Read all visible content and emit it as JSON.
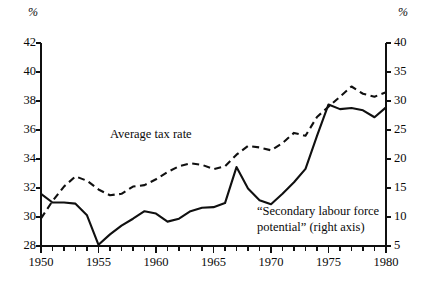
{
  "figure": {
    "left_axis_unit": "%",
    "right_axis_unit": "%",
    "background": "#ffffff",
    "ink": "#101010"
  },
  "labels": {
    "average_tax_rate": "Average tax rate",
    "secondary_line1": "“Secondary labour force",
    "secondary_line2": "potential” (right axis)"
  },
  "axes": {
    "x_tick_labels": [
      "1950",
      "1955",
      "1960",
      "1965",
      "1970",
      "1975",
      "1980"
    ],
    "left_tick_labels": [
      "28",
      "30",
      "32",
      "34",
      "36",
      "38",
      "40",
      "42"
    ],
    "right_tick_labels": [
      "5",
      "10",
      "15",
      "20",
      "25",
      "30",
      "35",
      "40"
    ]
  },
  "chart_data": {
    "type": "line",
    "title": "",
    "xlabel": "",
    "ylabel": "%",
    "y2label": "%",
    "grid": false,
    "legend": "inline-annotation",
    "xlim": [
      1950,
      1980
    ],
    "ylim": [
      28,
      42
    ],
    "y2lim": [
      5,
      40
    ],
    "xticks": [
      1950,
      1951,
      1952,
      1953,
      1954,
      1955,
      1956,
      1957,
      1958,
      1959,
      1960,
      1961,
      1962,
      1963,
      1964,
      1965,
      1966,
      1967,
      1968,
      1969,
      1970,
      1971,
      1972,
      1973,
      1974,
      1975,
      1976,
      1977,
      1978,
      1979,
      1980
    ],
    "xtick_labels_shown": [
      1950,
      1955,
      1960,
      1965,
      1970,
      1975,
      1980
    ],
    "yticks": [
      28,
      30,
      32,
      34,
      36,
      38,
      40,
      42
    ],
    "y2ticks": [
      5,
      10,
      15,
      20,
      25,
      30,
      35,
      40
    ],
    "x": [
      1950,
      1951,
      1952,
      1953,
      1954,
      1955,
      1956,
      1957,
      1958,
      1959,
      1960,
      1961,
      1962,
      1963,
      1964,
      1965,
      1966,
      1967,
      1968,
      1969,
      1970,
      1971,
      1972,
      1973,
      1974,
      1975,
      1976,
      1977,
      1978,
      1979,
      1980
    ],
    "series": [
      {
        "name": "Average tax rate",
        "axis": "left",
        "style": "dashed",
        "values": [
          29.9,
          31.1,
          32.1,
          32.8,
          32.5,
          31.9,
          31.5,
          31.6,
          32.1,
          32.2,
          32.6,
          33.1,
          33.5,
          33.7,
          33.6,
          33.3,
          33.5,
          34.3,
          34.9,
          34.8,
          34.6,
          35.1,
          35.8,
          35.6,
          36.9,
          37.6,
          38.3,
          39.0,
          38.5,
          38.3,
          38.6
        ]
      },
      {
        "name": "“Secondary labour force potential”",
        "axis": "right",
        "style": "solid",
        "values": [
          14.0,
          12.5,
          12.5,
          12.3,
          10.3,
          5.2,
          7.0,
          8.5,
          9.7,
          11.0,
          10.6,
          9.2,
          9.7,
          11.0,
          11.6,
          11.7,
          12.4,
          18.6,
          14.9,
          12.9,
          12.2,
          14.0,
          16.0,
          18.3,
          24.0,
          29.4,
          28.6,
          28.8,
          28.4,
          27.2,
          28.9
        ]
      }
    ]
  }
}
